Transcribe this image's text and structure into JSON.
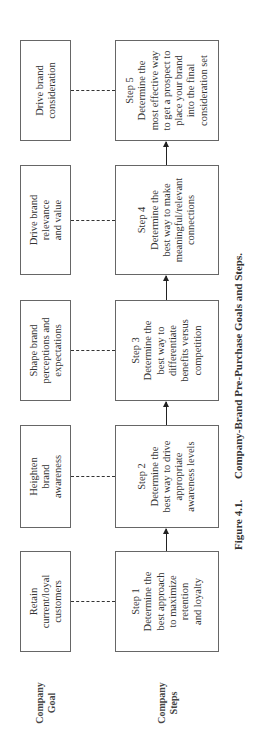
{
  "row_labels": {
    "goal": [
      "Company",
      "Goal"
    ],
    "steps": [
      "Company",
      "Steps"
    ]
  },
  "goals": [
    {
      "lines": [
        "Retain",
        "current/loyal",
        "customers"
      ]
    },
    {
      "lines": [
        "Heighten",
        "brand",
        "awareness"
      ]
    },
    {
      "lines": [
        "Shape brand",
        "perceptions and",
        "expectations"
      ]
    },
    {
      "lines": [
        "Drive brand",
        "relevance",
        "and value"
      ]
    },
    {
      "lines": [
        "Drive brand",
        "consideration"
      ]
    }
  ],
  "steps": [
    {
      "title": "Step 1",
      "lines": [
        "Determine the",
        "best approach",
        "to maximize",
        "retention",
        "and loyalty"
      ]
    },
    {
      "title": "Step 2",
      "lines": [
        "Determine the",
        "best way to drive",
        "appropriate",
        "awareness levels"
      ]
    },
    {
      "title": "Step 3",
      "lines": [
        "Determine the",
        "best way to",
        "differentiate",
        "benefits versus",
        "competition"
      ]
    },
    {
      "title": "Step 4",
      "lines": [
        "Determine the",
        "best way to make",
        "meaningful/relevant",
        "connections"
      ]
    },
    {
      "title": "Step 5",
      "lines": [
        "Determine the",
        "most effective way",
        "to get a prospect to",
        "place your brand",
        "into the final",
        "consideration set"
      ]
    }
  ],
  "caption": {
    "figure": "Figure 4.1.",
    "text": "Company-Brand Pre-Purchase Goals and Steps."
  }
}
